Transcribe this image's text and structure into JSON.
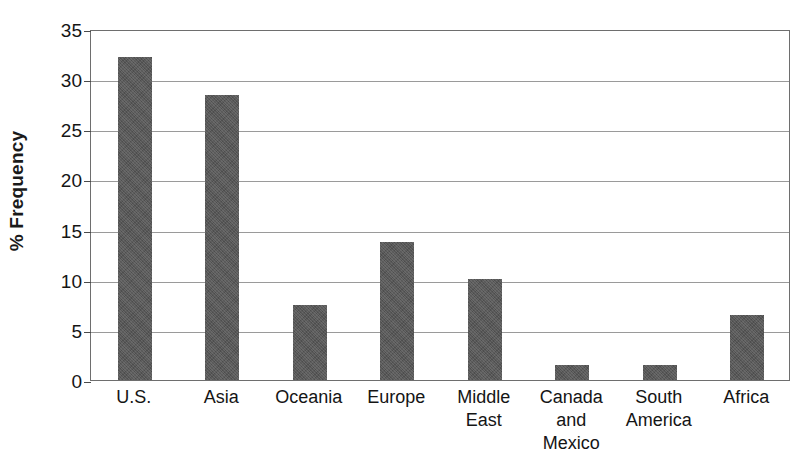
{
  "chart_data": {
    "type": "bar",
    "title": "",
    "xlabel": "",
    "ylabel": "% Frequency",
    "ylim": [
      0,
      35
    ],
    "ytick_interval": 5,
    "yticks": [
      0,
      5,
      10,
      15,
      20,
      25,
      30,
      35
    ],
    "ytick_labels": [
      "0",
      "5",
      "10",
      "15",
      "20",
      "25",
      "30",
      "35"
    ],
    "grid": true,
    "legend": "none",
    "categories": [
      "U.S.",
      "Asia",
      "Oceania",
      "Europe",
      "Middle East",
      "Canada and Mexico",
      "South America",
      "Africa"
    ],
    "category_label_lines": [
      [
        "U.S."
      ],
      [
        "Asia"
      ],
      [
        "Oceania"
      ],
      [
        "Europe"
      ],
      [
        "Middle",
        "East"
      ],
      [
        "Canada",
        "and",
        "Mexico"
      ],
      [
        "South",
        "America"
      ],
      [
        "Africa"
      ]
    ],
    "values": [
      32.2,
      28.4,
      7.5,
      13.8,
      10.1,
      1.5,
      1.5,
      6.5
    ],
    "bar_color": "#585858",
    "axis_color": "#6e6e6e",
    "gridline_color": "#9a9a9a",
    "text_color": "#151515"
  }
}
